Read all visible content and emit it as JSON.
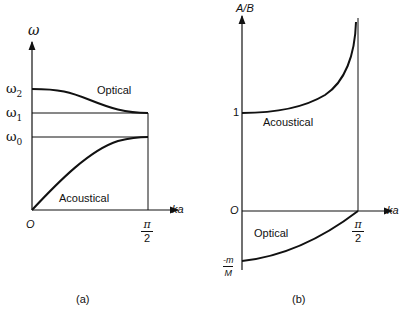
{
  "panel_a": {
    "caption": "(a)",
    "y_axis_label": "ω",
    "x_axis_label": "ka",
    "origin_label": "O",
    "x_end_label_num": "π",
    "x_end_label_den": "2",
    "levels": [
      {
        "name": "ω2",
        "base": "ω",
        "sub": "2"
      },
      {
        "name": "ω1",
        "base": "ω",
        "sub": "1"
      },
      {
        "name": "ω0",
        "base": "ω",
        "sub": "0"
      }
    ],
    "branches": {
      "optical": "Optical",
      "acoustical": "Acoustical"
    }
  },
  "panel_b": {
    "caption": "(b)",
    "y_axis_label": "A/B",
    "x_axis_label": "ka",
    "origin_label": "O",
    "one_label": "1",
    "x_end_label_num": "π",
    "x_end_label_den": "2",
    "neg_label_num": "-m",
    "neg_label_den": "M",
    "branches": {
      "optical": "Optical",
      "acoustical": "Acoustical"
    }
  },
  "colors": {
    "ink": "#111111",
    "background": "#ffffff"
  }
}
